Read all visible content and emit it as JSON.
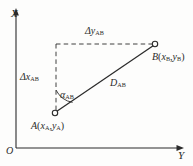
{
  "figure": {
    "background_color": "#fdfdfc",
    "line_color": "#2b2b2b",
    "axes": {
      "vertical_label": "X",
      "horizontal_label": "Y",
      "origin_label": "O",
      "vertical_axis": {
        "x": 16,
        "y_top": 12,
        "y_bottom": 148
      },
      "horizontal_axis": {
        "y": 148,
        "x_left": 16,
        "x_right": 180
      }
    },
    "points": [
      {
        "name": "A",
        "label_main": "A",
        "label_x": "x",
        "label_x_sub": "A",
        "label_y": "y",
        "label_y_sub": "A",
        "px": 55,
        "py": 113
      },
      {
        "name": "B",
        "label_main": "B",
        "label_x": "x",
        "label_x_sub": "B",
        "label_y": "y",
        "label_y_sub": "B",
        "px": 155,
        "py": 44
      }
    ],
    "annotations": {
      "delta_y": {
        "symbol": "Δy",
        "subscript": "AB"
      },
      "delta_x": {
        "symbol": "Δx",
        "subscript": "AB"
      },
      "alpha": {
        "symbol": "α",
        "subscript": "AB"
      },
      "distance": {
        "symbol": "D",
        "subscript": "AB"
      }
    },
    "dashed_corner": {
      "x": 56,
      "y": 44
    }
  }
}
